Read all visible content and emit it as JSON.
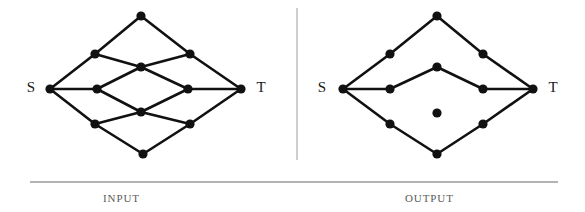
{
  "figure": {
    "width": 585,
    "height": 212,
    "background": "#ffffff",
    "ink_color": "#111111",
    "rule_color": "#9a9a9a",
    "divider_color": "#b9b9b9"
  },
  "captions": {
    "input": "INPUT",
    "output": "OUTPUT"
  },
  "dividers": {
    "vertical": {
      "x": 297,
      "y1": 8,
      "y2": 160
    },
    "horizontal": {
      "x1": 30,
      "x2": 558,
      "y": 182
    }
  },
  "graphs": [
    {
      "id": "input-graph",
      "name": "input-graph",
      "source_label": "S",
      "sink_label": "T",
      "source_label_pos": {
        "x": 31,
        "y": 89
      },
      "sink_label_pos": {
        "x": 261,
        "y": 89
      },
      "node_radius": 4.6,
      "nodes": [
        {
          "id": "S",
          "x": 50,
          "y": 89
        },
        {
          "id": "n1",
          "x": 141,
          "y": 16
        },
        {
          "id": "n2",
          "x": 95,
          "y": 54
        },
        {
          "id": "n3",
          "x": 190,
          "y": 54
        },
        {
          "id": "n4",
          "x": 141,
          "y": 67
        },
        {
          "id": "n5",
          "x": 97,
          "y": 89
        },
        {
          "id": "n6",
          "x": 188,
          "y": 89
        },
        {
          "id": "n7",
          "x": 141,
          "y": 112
        },
        {
          "id": "n8",
          "x": 95,
          "y": 124
        },
        {
          "id": "n9",
          "x": 190,
          "y": 124
        },
        {
          "id": "n10",
          "x": 143,
          "y": 154
        },
        {
          "id": "T",
          "x": 241,
          "y": 89
        }
      ],
      "edges": [
        [
          "S",
          "n2"
        ],
        [
          "S",
          "n5"
        ],
        [
          "S",
          "n8"
        ],
        [
          "n2",
          "n1"
        ],
        [
          "n1",
          "n3"
        ],
        [
          "n2",
          "n4"
        ],
        [
          "n4",
          "n3"
        ],
        [
          "n3",
          "T"
        ],
        [
          "n5",
          "n4"
        ],
        [
          "n4",
          "n6"
        ],
        [
          "n5",
          "n7"
        ],
        [
          "n7",
          "n6"
        ],
        [
          "n6",
          "T"
        ],
        [
          "n8",
          "n7"
        ],
        [
          "n7",
          "n9"
        ],
        [
          "n8",
          "n10"
        ],
        [
          "n10",
          "n9"
        ],
        [
          "n9",
          "T"
        ]
      ]
    },
    {
      "id": "output-graph",
      "name": "output-graph",
      "source_label": "S",
      "sink_label": "T",
      "source_label_pos": {
        "x": 322,
        "y": 89
      },
      "sink_label_pos": {
        "x": 553,
        "y": 89
      },
      "node_radius": 4.6,
      "nodes": [
        {
          "id": "S",
          "x": 343,
          "y": 89
        },
        {
          "id": "m1",
          "x": 390,
          "y": 54
        },
        {
          "id": "m2",
          "x": 437,
          "y": 16
        },
        {
          "id": "m3",
          "x": 483,
          "y": 54
        },
        {
          "id": "m4",
          "x": 390,
          "y": 89
        },
        {
          "id": "m5",
          "x": 437,
          "y": 67
        },
        {
          "id": "m6",
          "x": 483,
          "y": 89
        },
        {
          "id": "m7",
          "x": 390,
          "y": 124
        },
        {
          "id": "m8",
          "x": 437,
          "y": 154
        },
        {
          "id": "m9",
          "x": 483,
          "y": 124
        },
        {
          "id": "iso",
          "x": 437,
          "y": 113
        },
        {
          "id": "T",
          "x": 533,
          "y": 89
        }
      ],
      "isolated_nodes": [
        "iso"
      ],
      "edges": [
        [
          "S",
          "m1"
        ],
        [
          "m1",
          "m2"
        ],
        [
          "m2",
          "m3"
        ],
        [
          "m3",
          "T"
        ],
        [
          "S",
          "m4"
        ],
        [
          "m4",
          "m5"
        ],
        [
          "m5",
          "m6"
        ],
        [
          "m6",
          "T"
        ],
        [
          "S",
          "m7"
        ],
        [
          "m7",
          "m8"
        ],
        [
          "m8",
          "m9"
        ],
        [
          "m9",
          "T"
        ]
      ]
    }
  ]
}
